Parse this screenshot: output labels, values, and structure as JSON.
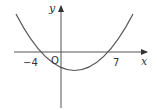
{
  "diagram": {
    "type": "function-graph",
    "axes": {
      "x_label": "x",
      "y_label": "y",
      "origin_label": "O"
    },
    "x_intercepts": [
      {
        "value": -4,
        "label": "−4"
      },
      {
        "value": 7,
        "label": "7"
      }
    ],
    "curve": {
      "kind": "parabola",
      "opens": "up",
      "roots": [
        -4,
        7
      ]
    },
    "colors": {
      "axis": "#555555",
      "curve": "#555555",
      "text": "#333333",
      "background": "#ffffff"
    }
  }
}
